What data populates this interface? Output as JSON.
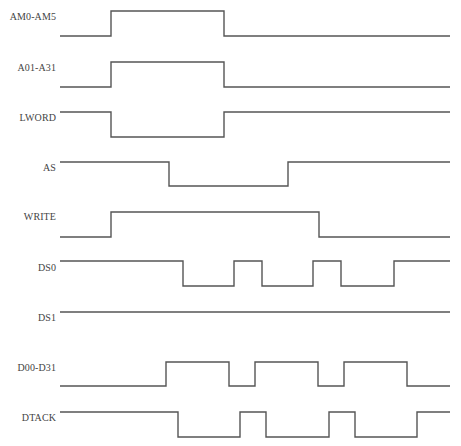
{
  "diagram": {
    "line_color": "#555555",
    "x_start": 60,
    "x_end": 450,
    "signals": [
      {
        "name": "AM0-AM5",
        "label_y": 17,
        "high_y": 11,
        "low_y": 36,
        "start": "low",
        "transitions": [
          111,
          224
        ]
      },
      {
        "name": "A01-A31",
        "label_y": 68,
        "high_y": 62,
        "low_y": 87,
        "start": "low",
        "transitions": [
          111,
          224
        ]
      },
      {
        "name": "LWORD",
        "label_y": 118,
        "high_y": 112,
        "low_y": 137,
        "start": "high",
        "transitions": [
          111,
          224
        ]
      },
      {
        "name": "AS",
        "label_y": 168,
        "high_y": 162,
        "low_y": 186,
        "start": "high",
        "transitions": [
          169,
          288
        ]
      },
      {
        "name": "WRITE",
        "label_y": 217,
        "high_y": 212,
        "low_y": 237,
        "start": "low",
        "transitions": [
          111,
          319
        ]
      },
      {
        "name": "DS0",
        "label_y": 268,
        "high_y": 261,
        "low_y": 286,
        "start": "high",
        "transitions": [
          183,
          234,
          262,
          313,
          341,
          394
        ]
      },
      {
        "name": "DS1",
        "label_y": 318,
        "high_y": 312,
        "low_y": 337,
        "start": "high",
        "transitions": []
      },
      {
        "name": "D00-D31",
        "label_y": 368,
        "high_y": 362,
        "low_y": 386,
        "start": "low",
        "transitions": [
          166,
          229,
          255,
          318,
          344,
          407
        ]
      },
      {
        "name": "DTACK",
        "label_y": 418,
        "high_y": 412,
        "low_y": 437,
        "start": "high",
        "transitions": [
          178,
          240,
          266,
          329,
          355,
          417
        ]
      }
    ]
  }
}
